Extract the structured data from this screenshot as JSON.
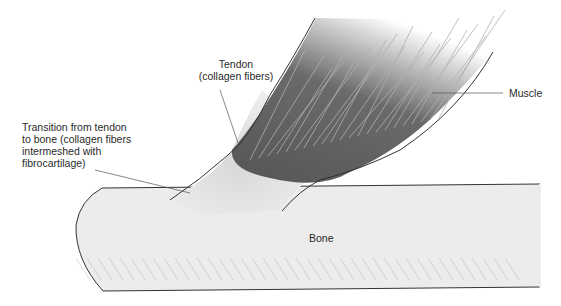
{
  "figure": {
    "labels": {
      "tendon": [
        "Tendon",
        "(collagen fibers)"
      ],
      "transition": [
        "Transition from tendon",
        "to bone (collagen fibers",
        "intermeshed with",
        "fibrocartilage)"
      ],
      "muscle": "Muscle",
      "bone": "Bone"
    },
    "colors": {
      "bone_fill": "#ebebeb",
      "muscle_dark": "#5a5a5a",
      "tendon_fill": "#e4e4e4",
      "outline": "#333333",
      "leader": "#555555"
    }
  }
}
